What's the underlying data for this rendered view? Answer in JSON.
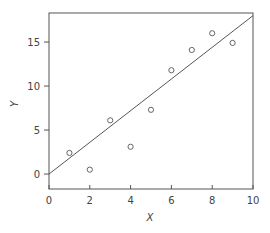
{
  "chart_data": {
    "type": "scatter",
    "title": "",
    "xlabel": "X",
    "ylabel": "Y",
    "xlim": [
      0,
      10
    ],
    "ylim": [
      -1.7,
      18.3
    ],
    "x_ticks": [
      0,
      2,
      4,
      6,
      8,
      10
    ],
    "y_ticks": [
      0,
      5,
      10,
      15
    ],
    "grid": false,
    "legend": null,
    "series": [
      {
        "name": "observations",
        "kind": "scatter",
        "marker": "open-circle",
        "x": [
          1,
          2,
          3,
          4,
          5,
          6,
          7,
          8,
          9
        ],
        "y": [
          2.4,
          0.5,
          6.1,
          3.1,
          7.3,
          11.8,
          14.1,
          16.0,
          14.9
        ]
      },
      {
        "name": "fitted line",
        "kind": "line",
        "x": [
          0,
          10
        ],
        "y": [
          0,
          18
        ]
      }
    ],
    "colors": {
      "axis": "#555555",
      "marker": "#555555",
      "line": "#555555",
      "text": "#444444"
    }
  }
}
